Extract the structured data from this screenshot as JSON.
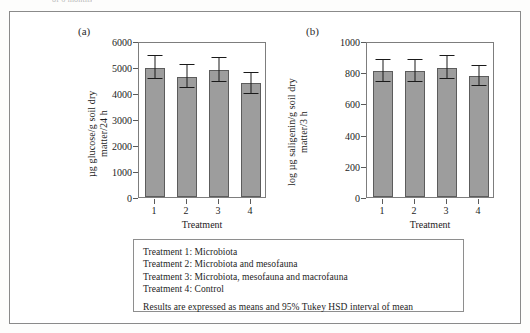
{
  "figure": {
    "caption_remnant": "of 6 months",
    "xlabel": "Treatment"
  },
  "panels": [
    {
      "letter": "(a)",
      "ylabel": "µg glucose/g soil dry\nmatter/24 h"
    },
    {
      "letter": "(b)",
      "ylabel": "log µg saligenin/g soil dry\nmatter/3 h"
    }
  ],
  "legend": {
    "items": [
      "Treatment 1: Microbiota",
      "Treatment 2: Microbiota and mesofauna",
      "Treatment 3: Microbiota, mesofauna and macrofauna",
      "Treatment 4: Control"
    ],
    "note": "Results are expressed as means and 95% Tukey HSD interval of mean"
  },
  "colors": {
    "bar_fill": "#9d9d9d",
    "bar_stroke": "#5c5c5c",
    "axis": "#7d7d7d",
    "error": "#1a1a1a",
    "text": "#1d1d1d",
    "frame": "#8a8a8a"
  },
  "chart_data": [
    {
      "type": "bar",
      "panel": "(a)",
      "title": "",
      "xlabel": "Treatment",
      "ylabel": "µg glucose/g soil dry matter/24 h",
      "categories": [
        "1",
        "2",
        "3",
        "4"
      ],
      "values": [
        4980,
        4630,
        4880,
        4380
      ],
      "errors_upper": [
        450,
        440,
        470,
        400
      ],
      "errors_lower": [
        450,
        440,
        470,
        400
      ],
      "ylim": [
        0,
        6000
      ],
      "yticks": [
        0,
        1000,
        2000,
        3000,
        4000,
        5000,
        6000
      ],
      "ytick_labels": [
        "0",
        "1000",
        "2000",
        "3000",
        "4000",
        "5000",
        "6000"
      ],
      "grid": false,
      "legend": "none",
      "error_type": "95% Tukey HSD interval of mean"
    },
    {
      "type": "bar",
      "panel": "(b)",
      "title": "",
      "xlabel": "Treatment",
      "ylabel": "log µg saligenin/g soil dry matter/3 h",
      "categories": [
        "1",
        "2",
        "3",
        "4"
      ],
      "values": [
        810,
        810,
        830,
        775
      ],
      "errors_upper": [
        70,
        70,
        75,
        65
      ],
      "errors_lower": [
        70,
        70,
        75,
        65
      ],
      "ylim": [
        0,
        1000
      ],
      "yticks": [
        0,
        200,
        400,
        600,
        800,
        1000
      ],
      "ytick_labels": [
        "0",
        "200",
        "400",
        "600",
        "800",
        "1000"
      ],
      "grid": false,
      "legend": "none",
      "error_type": "95% Tukey HSD interval of mean"
    }
  ]
}
